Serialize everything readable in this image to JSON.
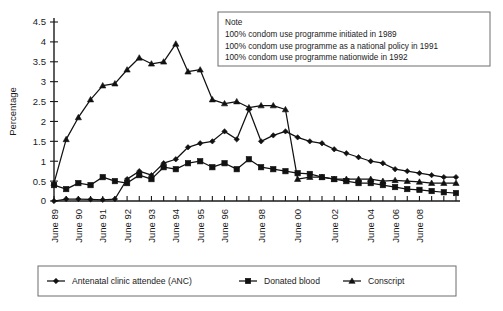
{
  "chart_data": {
    "type": "line",
    "title": "",
    "xlabel": "",
    "ylabel": "Percentage",
    "ylim": [
      0,
      4.5
    ],
    "ytick_values": [
      0,
      0.5,
      1,
      1.5,
      2,
      2.5,
      3,
      3.5,
      4,
      4.5
    ],
    "ytick_labels": [
      "0",
      "0.5",
      "1",
      "1.5",
      "2",
      "2.5",
      "3",
      "3.5",
      "4",
      "4.5"
    ],
    "grid": false,
    "legend_position": "bottom",
    "x_tick_count": 30,
    "xtick_labels": [
      {
        "index": 0,
        "label": "June 89"
      },
      {
        "index": 2,
        "label": "June 90"
      },
      {
        "index": 4,
        "label": "June 91"
      },
      {
        "index": 6,
        "label": "June 92"
      },
      {
        "index": 8,
        "label": "June 93"
      },
      {
        "index": 10,
        "label": "June 94"
      },
      {
        "index": 12,
        "label": "June 95"
      },
      {
        "index": 14,
        "label": "June 96"
      },
      {
        "index": 17,
        "label": "June 98"
      },
      {
        "index": 20,
        "label": "June 00"
      },
      {
        "index": 23,
        "label": "June 02"
      },
      {
        "index": 26,
        "label": "June 04"
      },
      {
        "index": 28,
        "label": "June 06"
      },
      {
        "index": 30,
        "label": "June 08"
      }
    ],
    "series": [
      {
        "name": "Antenatal clinic attendee (ANC)",
        "marker": "diamond",
        "values": [
          0.0,
          0.05,
          0.05,
          0.04,
          0.03,
          0.05,
          0.55,
          0.75,
          0.65,
          0.95,
          1.05,
          1.35,
          1.45,
          1.5,
          1.75,
          1.55,
          2.3,
          1.5,
          1.65,
          1.75,
          1.6,
          1.5,
          1.45,
          1.3,
          1.2,
          1.1,
          1.0,
          0.95,
          0.8,
          0.75,
          0.7,
          0.65,
          0.6,
          0.6
        ]
      },
      {
        "name": "Donated blood",
        "marker": "square",
        "values": [
          0.4,
          0.3,
          0.45,
          0.4,
          0.6,
          0.5,
          0.45,
          0.65,
          0.55,
          0.85,
          0.8,
          0.95,
          1.0,
          0.85,
          0.95,
          0.8,
          1.05,
          0.85,
          0.8,
          0.75,
          0.7,
          0.68,
          0.6,
          0.55,
          0.5,
          0.45,
          0.45,
          0.4,
          0.35,
          0.3,
          0.28,
          0.25,
          0.22,
          0.2
        ]
      },
      {
        "name": "Conscript",
        "marker": "triangle",
        "values": [
          0.45,
          1.55,
          2.1,
          2.55,
          2.9,
          2.95,
          3.3,
          3.6,
          3.45,
          3.5,
          3.95,
          3.25,
          3.3,
          2.55,
          2.45,
          2.5,
          2.35,
          2.4,
          2.4,
          2.3,
          0.55,
          0.6,
          0.6,
          0.55,
          0.55,
          0.55,
          0.55,
          0.5,
          0.52,
          0.5,
          0.48,
          0.45,
          0.45,
          0.45
        ]
      }
    ],
    "note": {
      "heading": "Note",
      "lines": [
        "100% condom use programme initiated in 1989",
        "100% condom use programme as a national policy in 1991",
        "100% condom use programme nationwide in 1992"
      ]
    }
  }
}
